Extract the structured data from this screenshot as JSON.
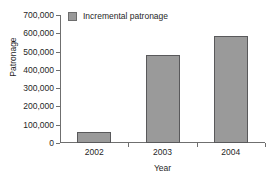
{
  "chart_data": {
    "type": "bar",
    "title": "",
    "xlabel": "Year",
    "ylabel": "Patronage",
    "categories": [
      "2002",
      "2003",
      "2004"
    ],
    "values": [
      62000,
      480000,
      585000
    ],
    "series": [
      {
        "name": "Incremental patronage",
        "values": [
          62000,
          480000,
          585000
        ]
      }
    ],
    "ylim": [
      0,
      700000
    ],
    "ytick_values": [
      0,
      100000,
      200000,
      300000,
      400000,
      500000,
      600000,
      700000
    ],
    "ytick_labels": [
      "0",
      "100,000",
      "200,000",
      "300,000",
      "400,000",
      "500,000",
      "600,000",
      "700,000"
    ],
    "grid": false,
    "legend_position": "top-left",
    "legend": [
      {
        "label": "Incremental patronage",
        "color": "#9a9a9a",
        "border_color": "#6d6d6d"
      }
    ],
    "colors": {
      "bar_fill": "#9a9a9a",
      "bar_border": "#59595b",
      "axis": "#6f6f6f",
      "text": "#1f1f1f",
      "background": "#ffffff"
    }
  }
}
